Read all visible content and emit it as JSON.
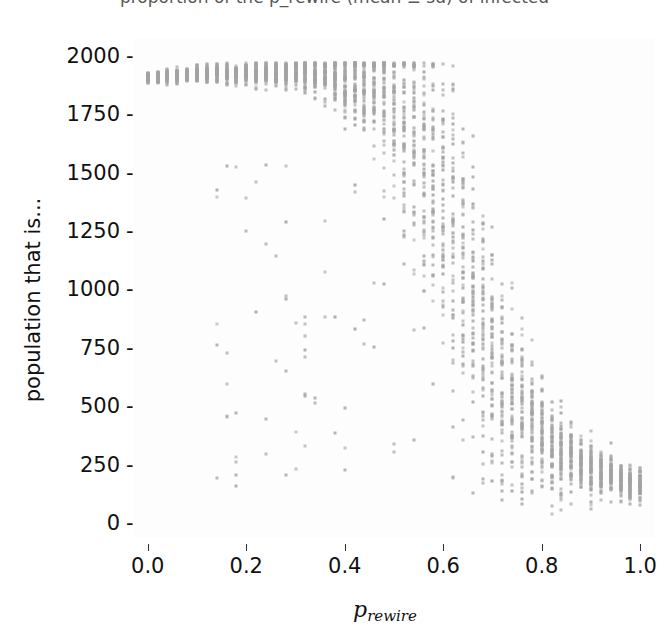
{
  "figure": {
    "title_clipped": "proportion of the p_rewire (mean ± sd) of infected",
    "background_color": "#ffffff",
    "point_color": "#a3a3a3"
  },
  "axes": {
    "ylabel": "population that is...",
    "xlabel_base": "p",
    "xlabel_sub": "rewire",
    "yticks": [
      "0",
      "250",
      "500",
      "750",
      "1000",
      "1250",
      "1500",
      "1750",
      "2000"
    ],
    "ytick_dash": "-",
    "xticks": [
      "0.0",
      "0.2",
      "0.4",
      "0.6",
      "0.8",
      "1.0"
    ]
  },
  "chart_data": {
    "type": "scatter",
    "title": "proportion of the p_rewire (mean ± sd) of infected",
    "xlabel": "p_rewire",
    "ylabel": "population that is...",
    "xlim": [
      -0.03,
      1.03
    ],
    "ylim": [
      -60,
      2080
    ],
    "xticks": [
      0.0,
      0.2,
      0.4,
      0.6,
      0.8,
      1.0
    ],
    "yticks": [
      0,
      250,
      500,
      750,
      1000,
      1250,
      1500,
      1750,
      2000
    ],
    "grid": false,
    "legend": false,
    "marker": "square",
    "marker_size": 3,
    "marker_color": "#a3a3a3",
    "x": [
      0.0,
      0.02,
      0.04,
      0.06,
      0.08,
      0.1,
      0.12,
      0.14,
      0.16,
      0.18,
      0.2,
      0.22,
      0.24,
      0.26,
      0.28,
      0.3,
      0.32,
      0.34,
      0.36,
      0.38,
      0.4,
      0.42,
      0.44,
      0.46,
      0.48,
      0.5,
      0.52,
      0.54,
      0.56,
      0.58,
      0.6,
      0.62,
      0.64,
      0.66,
      0.68,
      0.7,
      0.72,
      0.74,
      0.76,
      0.78,
      0.8,
      0.82,
      0.84,
      0.86,
      0.88,
      0.9,
      0.92,
      0.94,
      0.96,
      0.98,
      1.0
    ],
    "mean": [
      1908,
      1912,
      1916,
      1918,
      1922,
      1925,
      1927,
      1929,
      1930,
      1932,
      1933,
      1934,
      1934,
      1933,
      1932,
      1930,
      1927,
      1923,
      1918,
      1911,
      1901,
      1888,
      1872,
      1851,
      1823,
      1787,
      1742,
      1685,
      1612,
      1520,
      1408,
      1282,
      1140,
      996,
      860,
      735,
      628,
      540,
      468,
      412,
      368,
      332,
      302,
      278,
      258,
      240,
      224,
      210,
      196,
      182,
      168
    ],
    "sd": [
      18,
      20,
      22,
      24,
      26,
      28,
      30,
      32,
      34,
      36,
      38,
      40,
      42,
      45,
      48,
      52,
      58,
      66,
      76,
      90,
      110,
      136,
      168,
      206,
      250,
      298,
      348,
      398,
      442,
      476,
      496,
      500,
      490,
      466,
      430,
      388,
      342,
      296,
      252,
      212,
      178,
      150,
      128,
      110,
      96,
      86,
      78,
      72,
      66,
      62,
      58
    ],
    "n_replicates_per_x": 60,
    "low_outlier_fraction": 0.06
  }
}
